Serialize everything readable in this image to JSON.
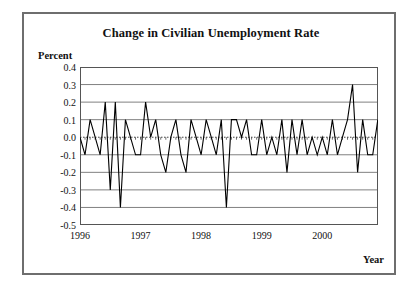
{
  "figure": {
    "title": "Change in Civilian Unemployment Rate",
    "y_axis_title": "Percent",
    "x_axis_title": "Year",
    "frame_color": "#6e6e6e",
    "line_color": "#000000",
    "gridline_color": "#808080",
    "background": "#ffffff"
  },
  "chart_data": {
    "type": "line",
    "title": "Change in Civilian Unemployment Rate",
    "subtitle": "",
    "xlabel": "Year",
    "ylabel": "Percent",
    "ylim": [
      -0.5,
      0.4
    ],
    "yticks": [
      0.4,
      0.3,
      0.2,
      0.1,
      0.0,
      -0.1,
      -0.2,
      -0.3,
      -0.4,
      -0.5
    ],
    "ytick_labels": [
      "0.4",
      "0.3",
      "0.2",
      "0.1",
      "0.0",
      "-0.1",
      "-0.2",
      "-0.3",
      "-0.4",
      "-0.5"
    ],
    "xlim": [
      1996.0,
      2000.92
    ],
    "xticks": [
      1996,
      1997,
      1998,
      1999,
      2000
    ],
    "xtick_labels": [
      "1996",
      "1997",
      "1998",
      "1999",
      "2000"
    ],
    "grid": true,
    "grid_axis": "y",
    "zero_line": true,
    "zero_line_style": "dotted",
    "legend": false,
    "legend_position": "none",
    "annotations": [],
    "series": [
      {
        "name": "Change in Civilian Unemployment Rate",
        "x": [
          1996.0,
          1996.083,
          1996.167,
          1996.25,
          1996.333,
          1996.417,
          1996.5,
          1996.583,
          1996.667,
          1996.75,
          1996.833,
          1996.917,
          1997.0,
          1997.083,
          1997.167,
          1997.25,
          1997.333,
          1997.417,
          1997.5,
          1997.583,
          1997.667,
          1997.75,
          1997.833,
          1997.917,
          1998.0,
          1998.083,
          1998.167,
          1998.25,
          1998.333,
          1998.417,
          1998.5,
          1998.583,
          1998.667,
          1998.75,
          1998.833,
          1998.917,
          1999.0,
          1999.083,
          1999.167,
          1999.25,
          1999.333,
          1999.417,
          1999.5,
          1999.583,
          1999.667,
          1999.75,
          1999.833,
          1999.917,
          2000.0,
          2000.083,
          2000.167,
          2000.25,
          2000.333,
          2000.417,
          2000.5,
          2000.583,
          2000.667,
          2000.75,
          2000.833,
          2000.917
        ],
        "values": [
          0.0,
          -0.1,
          0.1,
          0.0,
          -0.1,
          0.2,
          -0.3,
          0.2,
          -0.4,
          0.1,
          0.0,
          -0.1,
          -0.1,
          0.2,
          0.0,
          0.1,
          -0.1,
          -0.2,
          0.0,
          0.1,
          -0.1,
          -0.2,
          0.1,
          0.0,
          -0.1,
          0.1,
          0.0,
          -0.1,
          0.1,
          -0.4,
          0.1,
          0.1,
          0.0,
          0.1,
          -0.1,
          -0.1,
          0.1,
          -0.1,
          0.0,
          -0.1,
          0.1,
          -0.2,
          0.1,
          -0.1,
          0.1,
          -0.1,
          0.0,
          -0.1,
          0.0,
          -0.1,
          0.1,
          -0.1,
          0.0,
          0.1,
          0.3,
          -0.2,
          0.1,
          -0.1,
          -0.1,
          0.1
        ]
      }
    ]
  }
}
